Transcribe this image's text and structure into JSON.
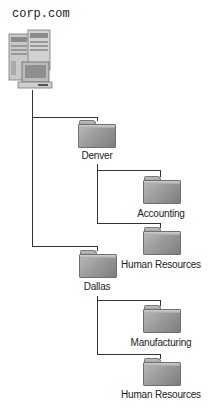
{
  "root": {
    "label": "corp.com",
    "icon": "server-workstation-icon"
  },
  "tree": [
    {
      "label": "Denver",
      "icon": "folder-icon",
      "children": [
        {
          "label": "Accounting",
          "icon": "folder-icon"
        },
        {
          "label": "Human Resources",
          "icon": "folder-icon"
        }
      ]
    },
    {
      "label": "Dallas",
      "icon": "folder-icon",
      "children": [
        {
          "label": "Manufacturing",
          "icon": "folder-icon"
        },
        {
          "label": "Human Resources",
          "icon": "folder-icon"
        }
      ]
    }
  ],
  "colors": {
    "line": "#333333",
    "folder": "#9c9c9c",
    "text": "#222222"
  }
}
